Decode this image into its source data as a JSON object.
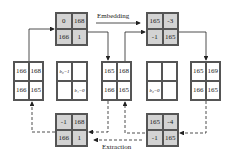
{
  "labels": {
    "embedding": "Embedding",
    "extraction": "Extraction"
  },
  "blocks": {
    "embed_a": [
      "0",
      "168",
      "166",
      "1"
    ],
    "embed_b": [
      "165",
      "-3",
      "-1",
      "165"
    ],
    "orig_left": [
      "166",
      "168",
      "166",
      "165"
    ],
    "bits_left": [
      "b₀=1",
      "",
      "",
      "b₁=0"
    ],
    "mid_pixels": [
      "165",
      "168",
      "166",
      "165"
    ],
    "bits_right": [
      "",
      "",
      "b₂=0",
      ""
    ],
    "stego_right": [
      "165",
      "169",
      "166",
      "165"
    ],
    "extract_a": [
      "-1",
      "168",
      "166",
      "1"
    ],
    "extract_b": [
      "165",
      "-4",
      "-1",
      "165"
    ]
  },
  "colors": {
    "transform_block": "#d3d3d3",
    "pixel_block": "#ffffff",
    "line": "#333333"
  }
}
